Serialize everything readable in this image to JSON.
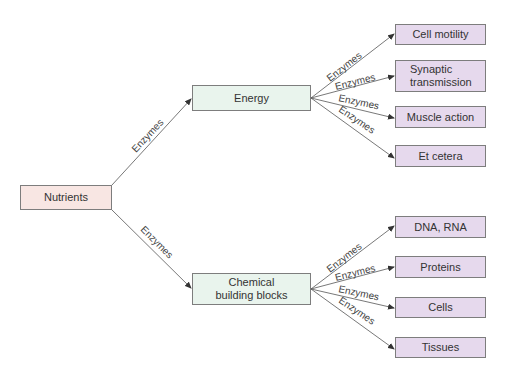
{
  "diagram": {
    "edge_label": "Enzymes",
    "root": {
      "label": "Nutrients"
    },
    "energy": {
      "label": "Energy",
      "children": [
        "Cell motility",
        "Synaptic transmission",
        "Muscle action",
        "Et cetera"
      ]
    },
    "chemical": {
      "label": "Chemical building blocks",
      "children": [
        "DNA, RNA",
        "Proteins",
        "Cells",
        "Tissues"
      ]
    },
    "colors": {
      "root_fill": "#f8e6e3",
      "mid_fill": "#e9f4ed",
      "leaf_fill": "#e6d9ed",
      "border": "#7d7d7d",
      "line": "#555555"
    }
  }
}
